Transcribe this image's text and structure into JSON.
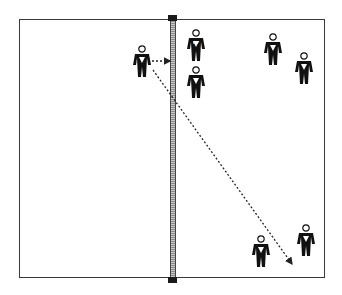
{
  "diagram": {
    "type": "volleyball-court-play",
    "colors": {
      "court_line": "#3a3a3a",
      "net": "#aaaaaa",
      "post": "#1a1a1a",
      "player": "#111111",
      "arrow": "#222222"
    },
    "court": {
      "left": 19,
      "top": 19,
      "right": 325,
      "bottom": 278
    },
    "net": {
      "x": 170,
      "width": 6,
      "top": 18,
      "bottom": 280
    },
    "posts": [
      {
        "name": "top",
        "x": 168,
        "y": 16
      },
      {
        "name": "bottom",
        "x": 168,
        "y": 277
      }
    ],
    "players": [
      {
        "id": "attacker",
        "side": "left",
        "x": 132,
        "y": 45,
        "label": ""
      },
      {
        "id": "front-right",
        "side": "right",
        "x": 186,
        "y": 29,
        "label": "RF"
      },
      {
        "id": "front-middle",
        "side": "right",
        "x": 186,
        "y": 66,
        "label": ""
      },
      {
        "id": "back-right-1",
        "side": "right",
        "x": 263,
        "y": 33,
        "label": ""
      },
      {
        "id": "back-right-2",
        "side": "right",
        "x": 294,
        "y": 52,
        "label": ""
      },
      {
        "id": "back-left-low",
        "side": "right",
        "x": 251,
        "y": 235,
        "label": ""
      },
      {
        "id": "back-right-low",
        "side": "right",
        "x": 296,
        "y": 224,
        "label": ""
      }
    ],
    "arrows": [
      {
        "id": "short-arrow",
        "x1": 152,
        "y1": 61,
        "x2": 170,
        "y2": 61
      },
      {
        "id": "long-diagonal-arrow",
        "x1": 153,
        "y1": 70,
        "x2": 292,
        "y2": 264
      }
    ]
  }
}
